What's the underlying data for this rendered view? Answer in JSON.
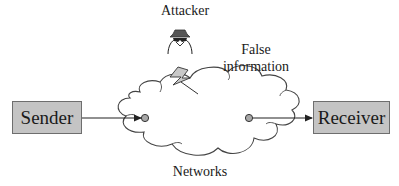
{
  "diagram": {
    "attacker_label": "Attacker",
    "false_info_line1": "False",
    "false_info_line2": "information",
    "network_label": "Networks",
    "sender_label": "Sender",
    "receiver_label": "Receiver",
    "icons": {
      "attacker": "attacker-icon",
      "attack": "lightning-bolt-icon",
      "network": "cloud-icon"
    },
    "colors": {
      "box_fill": "#c4c4c4",
      "box_border": "#6e6e6e",
      "node_fill": "#a8a8a8",
      "line": "#333333"
    }
  }
}
